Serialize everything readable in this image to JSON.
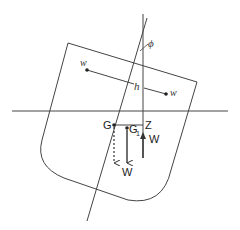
{
  "diagram": {
    "type": "ship-stability-heel",
    "labels": {
      "weight_left": "w",
      "weight_right": "w",
      "shift_distance": "h",
      "heel_angle": "ϕ",
      "center_of_gravity": "G",
      "shifted_center_of_gravity": "G",
      "shifted_subscript": "1",
      "righting_point": "Z",
      "buoyancy_force": "W",
      "weight_force": "W"
    },
    "colors": {
      "line": "#333333",
      "background": "#ffffff"
    }
  }
}
